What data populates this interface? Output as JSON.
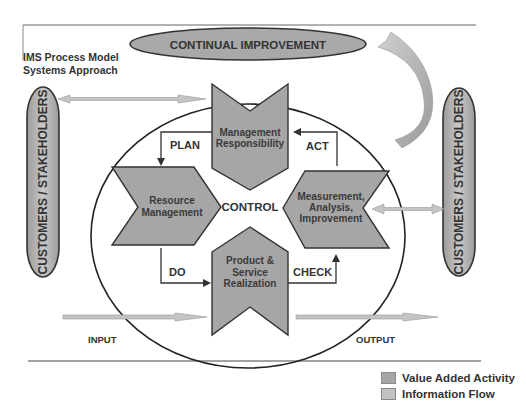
{
  "title": {
    "line1": "IMS Process Model",
    "line2": "Systems Approach"
  },
  "continual_improvement": "CONTINUAL IMPROVEMENT",
  "customers_left": "CUSTOMERS / STAKEHOLDERS",
  "customers_right": "CUSTOMERS / STAKEHOLDERS",
  "center_label": "CONTROL",
  "processes": {
    "top": {
      "line1": "Management",
      "line2": "Responsibility"
    },
    "left": {
      "line1": "Resource",
      "line2": "Management"
    },
    "right": {
      "line1": "Measurement,",
      "line2": "Analysis,",
      "line3": "Improvement"
    },
    "bottom": {
      "line1": "Product &",
      "line2": "Service",
      "line3": "Realization"
    }
  },
  "cycle": {
    "plan": "PLAN",
    "do": "DO",
    "check": "CHECK",
    "act": "ACT"
  },
  "flows": {
    "input": "INPUT",
    "output": "OUTPUT"
  },
  "legend": {
    "items": [
      {
        "label": "Value Added Activity",
        "color": "#a6a6a6"
      },
      {
        "label": "Information Flow",
        "color": "#c2c2c2"
      }
    ]
  },
  "colors": {
    "value_added": "#a6a6a6",
    "info_flow": "#c4c4c4",
    "stroke": "#333333"
  }
}
